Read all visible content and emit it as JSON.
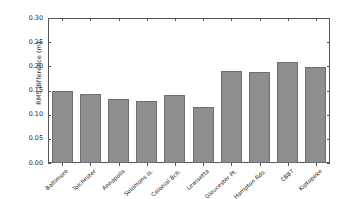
{
  "chart_data": {
    "type": "bar",
    "title": "",
    "xlabel": "",
    "ylabel": "RMS difference (m)",
    "categories": [
      "Baltimore",
      "Tolchester",
      "Annapolis",
      "Solomons Is.",
      "Colonial Bch.",
      "Lewisetta",
      "Gloucester Pt.",
      "Hampton Rds.",
      "CBBT",
      "Kiptopeke"
    ],
    "values": [
      0.148,
      0.143,
      0.133,
      0.128,
      0.141,
      0.116,
      0.191,
      0.189,
      0.209,
      0.199
    ],
    "ylim": [
      0.0,
      0.3
    ],
    "yticks": [
      "0.00",
      "0.05",
      "0.10",
      "0.15",
      "0.20",
      "0.25",
      "0.30"
    ],
    "ytick_values": [
      0.0,
      0.05,
      0.1,
      0.15,
      0.2,
      0.25,
      0.3
    ],
    "grid": false,
    "legend": null,
    "bar_color": "#8e8e8e",
    "bar_edge_color": "#6f6f6f",
    "axis_color": "#555555"
  }
}
